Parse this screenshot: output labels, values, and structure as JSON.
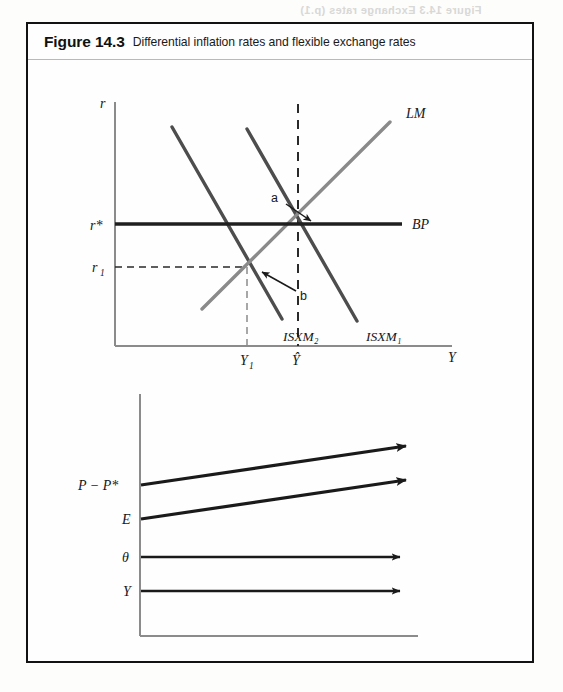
{
  "figure": {
    "number": "Figure 14.3",
    "title": "Differential inflation rates and flexible exchange rates"
  },
  "colors": {
    "frame": "#121212",
    "axis": "#8b8b8b",
    "is_curve": "#4d4d4d",
    "lm_curve": "#8a8a8a",
    "bp_line": "#1f1f1f",
    "dashed": "#2a2a2a",
    "arrow": "#1a1a1a",
    "label": "#17171a"
  },
  "upper_chart": {
    "y_axis_label": "r",
    "x_axis_label": "Y",
    "y_ticks": [
      {
        "label": "r*",
        "y_px": 200
      },
      {
        "label": "r",
        "sub": "1",
        "y_px": 243
      }
    ],
    "x_ticks": [
      {
        "label": "Y",
        "sub": "1",
        "x_px": 245
      },
      {
        "label": "Ŷ",
        "x_px": 296
      }
    ],
    "curves": [
      {
        "name": "ISXM",
        "sub": "2",
        "label": "ISXM₂",
        "type": "downward-sloping",
        "color": "#4d4d4d"
      },
      {
        "name": "ISXM",
        "sub": "1",
        "label": "ISXM₁",
        "type": "downward-sloping",
        "color": "#4d4d4d"
      },
      {
        "name": "LM",
        "label": "LM",
        "type": "upward-sloping",
        "color": "#8a8a8a"
      },
      {
        "name": "BP",
        "label": "BP",
        "type": "horizontal",
        "color": "#1f1f1f"
      }
    ],
    "points": [
      {
        "label": "a",
        "description": "intersection of ISXM1, LM and BP at r* and Y-hat"
      },
      {
        "label": "b",
        "description": "intersection of ISXM2 and LM at r1 and Y1"
      }
    ]
  },
  "lower_chart": {
    "series": [
      {
        "label": "P − P*",
        "trend": "rising",
        "thick": true
      },
      {
        "label": "E",
        "trend": "rising",
        "thick": true
      },
      {
        "label": "θ",
        "trend": "flat",
        "thick": false
      },
      {
        "label": "Y",
        "trend": "flat",
        "thick": false
      }
    ]
  },
  "artifacts": {
    "header_smudge": "Figure 14.3 Exchange rates (p.1)",
    "right_ghost": "Figure 14.4  Sections",
    "mid_ghost": "Figure 14.4  Flexible"
  }
}
